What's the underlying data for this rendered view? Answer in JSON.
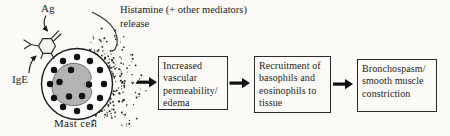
{
  "figure": {
    "antigen_label": "Ag",
    "ige_label": "IgE",
    "cell_label": "Mast cell",
    "histamine_label_line1": "Histamine (+ other mediators)",
    "histamine_label_line2": "release",
    "flow_boxes": [
      {
        "text": "Increased vascular permeability/ edema"
      },
      {
        "text": "Recruitment of basophils and eosinophils to tissue"
      },
      {
        "text": "Bronchospasm/ smooth muscle constriction"
      }
    ],
    "colors": {
      "ink": "#1c1c1c",
      "nucleus_fill": "#b3b3b3",
      "background": "#fbfaf7"
    }
  }
}
